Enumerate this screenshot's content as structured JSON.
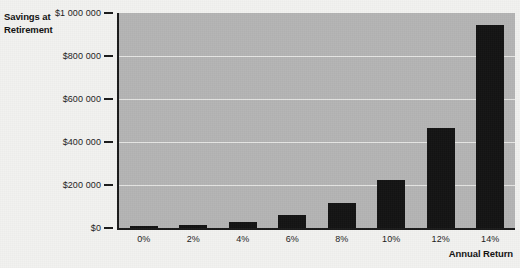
{
  "chart_data": {
    "type": "bar",
    "title": "",
    "ylabel": "Savings at Retirement",
    "xlabel": "Annual Return",
    "categories": [
      "0%",
      "2%",
      "4%",
      "6%",
      "8%",
      "10%",
      "12%",
      "14%"
    ],
    "values": [
      5000,
      15000,
      30000,
      60000,
      115000,
      225000,
      465000,
      945000
    ],
    "ylim": [
      0,
      1000000
    ],
    "ytick_values": [
      0,
      200000,
      400000,
      600000,
      800000,
      1000000
    ],
    "ytick_labels": [
      "$0",
      "$200 000",
      "$400 000",
      "$600 000",
      "$800 000",
      "$1 000 000"
    ],
    "grid": true,
    "legend": false,
    "bar_color": "#131313",
    "plot_background": "#b4b4b4",
    "gridline_color": "#e6e6e4",
    "axis_color": "#1a1a1a",
    "figure_background": "#f2f2f0"
  }
}
